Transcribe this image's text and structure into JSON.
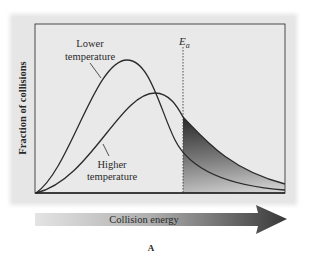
{
  "figure": {
    "panel_label": "A",
    "y_axis_label": "Fraction of collisions",
    "x_axis_label": "Collision energy",
    "threshold_label": "E",
    "threshold_subscript": "a",
    "curves": [
      {
        "name": "lower-temperature",
        "label_line1": "Lower",
        "label_line2": "temperature"
      },
      {
        "name": "higher-temperature",
        "label_line1": "Higher",
        "label_line2": "temperature"
      }
    ],
    "colors": {
      "panel_bg": "#e6e6e6",
      "plot_bg": "#e9e9e9",
      "curve": "#2b2b2b",
      "shade_dark": "#3a3a3a",
      "shade_light": "#d8d8d8",
      "arrow_light": "#e2e2e2",
      "arrow_dark": "#3c3c3c"
    }
  }
}
